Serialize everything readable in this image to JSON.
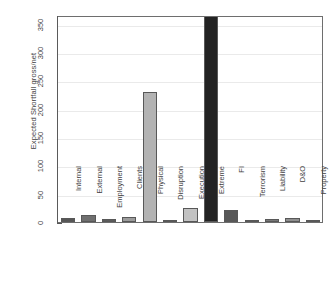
{
  "chart_data": {
    "type": "bar",
    "title": "",
    "xlabel": "",
    "ylabel": "Expected Shortfall gross/net",
    "categories": [
      "Internal",
      "External",
      "Employment",
      "Clients",
      "Physical",
      "Disruption",
      "Execution",
      "Extreme",
      "FI",
      "Terrorism",
      "Liability",
      "D&O",
      "Property"
    ],
    "values": [
      7,
      13,
      6,
      9,
      230,
      2,
      25,
      365,
      21,
      2,
      5,
      7,
      2
    ],
    "bar_colors": [
      "#565656",
      "#6f6f6f",
      "#5c5c5c",
      "#9c9c9c",
      "#b3b3b3",
      "#8a8a8a",
      "#c2c2c2",
      "#232323",
      "#585858",
      "#8a8a8a",
      "#787878",
      "#8f8f8f",
      "#8a8a8a"
    ],
    "ylim": [
      0,
      365
    ],
    "yticks": [
      0,
      50,
      100,
      150,
      200,
      250,
      300,
      350
    ],
    "ytick_labels": [
      "0",
      "50",
      "100",
      "150",
      "200",
      "250",
      "300",
      "350"
    ],
    "grid": true,
    "grid_color": "#eaeaea",
    "legend": "none",
    "axis_color": "#5a5a5a",
    "background": "#ffffff"
  }
}
